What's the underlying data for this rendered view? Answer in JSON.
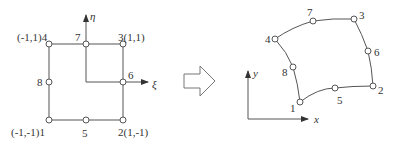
{
  "parent_element": {
    "axes": {
      "horizontal": "ξ",
      "vertical": "η"
    },
    "nodes": [
      {
        "id": "1",
        "label": "(-1,-1)1"
      },
      {
        "id": "2",
        "label": "2(1,-1)"
      },
      {
        "id": "3",
        "label": "3(1,1)"
      },
      {
        "id": "4",
        "label": "(-1,1)4"
      },
      {
        "id": "5",
        "label": "5"
      },
      {
        "id": "6",
        "label": "6"
      },
      {
        "id": "7",
        "label": "7"
      },
      {
        "id": "8",
        "label": "8"
      }
    ]
  },
  "mapping_arrow": {
    "icon": "right-arrow-icon"
  },
  "physical_element": {
    "axes": {
      "horizontal": "x",
      "vertical": "y"
    },
    "nodes": [
      {
        "id": "1",
        "label": "1"
      },
      {
        "id": "2",
        "label": "2"
      },
      {
        "id": "3",
        "label": "3"
      },
      {
        "id": "4",
        "label": "4"
      },
      {
        "id": "5",
        "label": "5"
      },
      {
        "id": "6",
        "label": "6"
      },
      {
        "id": "7",
        "label": "7"
      },
      {
        "id": "8",
        "label": "8"
      }
    ]
  }
}
